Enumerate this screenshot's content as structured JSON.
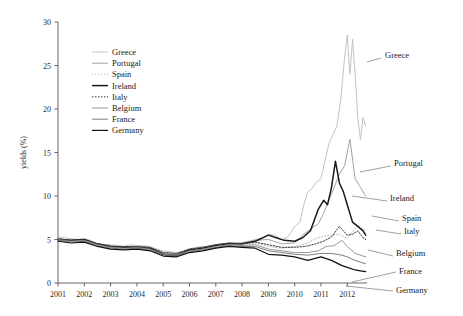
{
  "chart_data": {
    "type": "line",
    "title": "",
    "subtitle": "",
    "xlabel": "",
    "ylabel": "yields (%)",
    "xlim": [
      2001,
      2012.75
    ],
    "ylim": [
      0,
      30
    ],
    "yticks": [
      0,
      5,
      10,
      15,
      20,
      25,
      30
    ],
    "xticks": [
      2001,
      2002,
      2003,
      2004,
      2005,
      2006,
      2007,
      2008,
      2009,
      2010,
      2011,
      2012
    ],
    "xtick_labels": [
      "2001",
      "2002",
      "2003",
      "2004",
      "2005",
      "2006",
      "2007",
      "2008",
      "2009",
      "2010",
      "2011",
      "2012"
    ],
    "ytick_labels": [
      "0",
      "5",
      "10",
      "15",
      "20",
      "25",
      "30"
    ],
    "grid": false,
    "legend_position": "upper-left-inside",
    "series": [
      {
        "name": "Greece",
        "color": "#bcbcbc",
        "width": 0.9,
        "dash": "none",
        "annotation": "Greece",
        "x": [
          2001.0,
          2001.25,
          2001.5,
          2001.75,
          2002.0,
          2002.25,
          2002.5,
          2002.75,
          2003.0,
          2003.25,
          2003.5,
          2003.75,
          2004.0,
          2004.25,
          2004.5,
          2004.75,
          2005.0,
          2005.25,
          2005.5,
          2005.75,
          2006.0,
          2006.25,
          2006.5,
          2006.75,
          2007.0,
          2007.25,
          2007.5,
          2007.75,
          2008.0,
          2008.25,
          2008.5,
          2008.75,
          2009.0,
          2009.25,
          2009.5,
          2009.75,
          2010.0,
          2010.2,
          2010.35,
          2010.5,
          2010.65,
          2010.8,
          2011.0,
          2011.15,
          2011.3,
          2011.45,
          2011.6,
          2011.75,
          2011.9,
          2012.0,
          2012.1,
          2012.2,
          2012.3,
          2012.4,
          2012.5,
          2012.6,
          2012.7
        ],
        "y": [
          5.3,
          5.2,
          5.1,
          5.0,
          5.1,
          4.9,
          4.5,
          4.4,
          4.4,
          4.3,
          4.2,
          4.4,
          4.3,
          4.3,
          4.2,
          3.9,
          3.7,
          3.6,
          3.5,
          3.6,
          3.9,
          4.1,
          4.2,
          4.2,
          4.4,
          4.5,
          4.6,
          4.5,
          4.6,
          4.8,
          5.0,
          5.1,
          5.6,
          5.5,
          5.0,
          5.3,
          6.5,
          7.0,
          9.0,
          10.5,
          10.8,
          11.5,
          12.0,
          14.0,
          16.0,
          17.0,
          18.0,
          21.0,
          26.0,
          28.5,
          24.0,
          28.0,
          24.0,
          19.0,
          16.5,
          19.0,
          18.0
        ]
      },
      {
        "name": "Portugal",
        "color": "#999999",
        "width": 0.9,
        "dash": "none",
        "annotation": "Portugal",
        "x": [
          2001.0,
          2001.5,
          2002.0,
          2002.5,
          2003.0,
          2003.5,
          2004.0,
          2004.5,
          2005.0,
          2005.5,
          2006.0,
          2006.5,
          2007.0,
          2007.5,
          2008.0,
          2008.5,
          2009.0,
          2009.5,
          2010.0,
          2010.3,
          2010.6,
          2010.9,
          2011.1,
          2011.3,
          2011.5,
          2011.7,
          2011.9,
          2012.1,
          2012.3,
          2012.5,
          2012.7
        ],
        "y": [
          5.1,
          4.9,
          5.0,
          4.5,
          4.3,
          4.2,
          4.2,
          4.1,
          3.5,
          3.4,
          3.9,
          4.1,
          4.4,
          4.6,
          4.6,
          4.9,
          5.0,
          4.5,
          4.6,
          5.5,
          6.2,
          6.8,
          8.0,
          9.5,
          11.0,
          12.5,
          13.5,
          16.5,
          12.0,
          11.0,
          10.0
        ]
      },
      {
        "name": "Spain",
        "color": "#b5b5b5",
        "width": 1.0,
        "dash": "1,2",
        "annotation": "Spain",
        "x": [
          2001.0,
          2001.5,
          2002.0,
          2002.5,
          2003.0,
          2003.5,
          2004.0,
          2004.5,
          2005.0,
          2005.5,
          2006.0,
          2006.5,
          2007.0,
          2007.5,
          2008.0,
          2008.5,
          2009.0,
          2009.5,
          2010.0,
          2010.4,
          2010.8,
          2011.1,
          2011.4,
          2011.7,
          2012.0,
          2012.2,
          2012.4,
          2012.6,
          2012.7
        ],
        "y": [
          5.1,
          4.9,
          5.0,
          4.5,
          4.2,
          4.1,
          4.2,
          4.0,
          3.4,
          3.3,
          3.8,
          4.0,
          4.3,
          4.5,
          4.4,
          4.6,
          4.2,
          4.0,
          4.2,
          4.5,
          5.1,
          5.4,
          5.5,
          5.6,
          5.1,
          5.9,
          6.6,
          6.2,
          6.0
        ]
      },
      {
        "name": "Ireland",
        "color": "#1a1a1a",
        "width": 1.5,
        "dash": "none",
        "annotation": "Ireland",
        "x": [
          2001.0,
          2001.5,
          2002.0,
          2002.5,
          2003.0,
          2003.5,
          2004.0,
          2004.5,
          2005.0,
          2005.5,
          2006.0,
          2006.5,
          2007.0,
          2007.5,
          2008.0,
          2008.5,
          2009.0,
          2009.3,
          2009.6,
          2010.0,
          2010.3,
          2010.6,
          2010.9,
          2011.1,
          2011.25,
          2011.4,
          2011.55,
          2011.7,
          2011.85,
          2012.0,
          2012.2,
          2012.4,
          2012.6,
          2012.7
        ],
        "y": [
          5.0,
          4.9,
          5.0,
          4.5,
          4.2,
          4.1,
          4.1,
          4.0,
          3.3,
          3.2,
          3.8,
          4.0,
          4.3,
          4.5,
          4.5,
          4.8,
          5.5,
          5.2,
          4.9,
          4.8,
          5.2,
          6.0,
          8.5,
          9.5,
          9.0,
          11.0,
          14.0,
          11.5,
          10.5,
          9.0,
          7.0,
          6.5,
          6.0,
          5.5
        ]
      },
      {
        "name": "Italy",
        "color": "#3a3a3a",
        "width": 1.0,
        "dash": "1.5,1.5",
        "annotation": "Italy",
        "x": [
          2001.0,
          2001.5,
          2002.0,
          2002.5,
          2003.0,
          2003.5,
          2004.0,
          2004.5,
          2005.0,
          2005.5,
          2006.0,
          2006.5,
          2007.0,
          2007.5,
          2008.0,
          2008.5,
          2009.0,
          2009.5,
          2010.0,
          2010.4,
          2010.8,
          2011.1,
          2011.4,
          2011.7,
          2012.0,
          2012.2,
          2012.4,
          2012.6,
          2012.7
        ],
        "y": [
          5.1,
          4.9,
          5.0,
          4.5,
          4.2,
          4.2,
          4.2,
          4.1,
          3.5,
          3.4,
          3.9,
          4.1,
          4.4,
          4.6,
          4.5,
          4.7,
          4.4,
          4.1,
          4.1,
          4.2,
          4.5,
          4.8,
          5.3,
          6.5,
          5.5,
          5.6,
          6.0,
          5.2,
          5.0
        ]
      },
      {
        "name": "Belgium",
        "color": "#8a8a8a",
        "width": 0.9,
        "dash": "none",
        "annotation": "Belgium",
        "x": [
          2001.0,
          2001.5,
          2002.0,
          2002.5,
          2003.0,
          2003.5,
          2004.0,
          2004.5,
          2005.0,
          2005.5,
          2006.0,
          2006.5,
          2007.0,
          2007.5,
          2008.0,
          2008.5,
          2009.0,
          2009.5,
          2010.0,
          2010.5,
          2010.9,
          2011.2,
          2011.5,
          2011.8,
          2012.0,
          2012.3,
          2012.5,
          2012.7
        ],
        "y": [
          5.0,
          4.8,
          4.9,
          4.4,
          4.1,
          4.0,
          4.1,
          3.9,
          3.3,
          3.2,
          3.7,
          3.9,
          4.2,
          4.4,
          4.3,
          4.4,
          3.9,
          3.7,
          3.5,
          3.5,
          3.7,
          4.2,
          4.3,
          4.9,
          4.2,
          3.4,
          3.2,
          3.0
        ]
      },
      {
        "name": "France",
        "color": "#6e6e6e",
        "width": 0.9,
        "dash": "none",
        "annotation": "France",
        "x": [
          2001.0,
          2001.5,
          2002.0,
          2002.5,
          2003.0,
          2003.5,
          2004.0,
          2004.5,
          2005.0,
          2005.5,
          2006.0,
          2006.5,
          2007.0,
          2007.5,
          2008.0,
          2008.5,
          2009.0,
          2009.5,
          2010.0,
          2010.5,
          2011.0,
          2011.4,
          2011.8,
          2012.0,
          2012.3,
          2012.5,
          2012.7
        ],
        "y": [
          4.9,
          4.7,
          4.8,
          4.3,
          4.0,
          3.9,
          4.0,
          3.8,
          3.2,
          3.1,
          3.6,
          3.8,
          4.1,
          4.3,
          4.2,
          4.2,
          3.7,
          3.5,
          3.3,
          3.2,
          3.4,
          3.4,
          3.2,
          3.0,
          2.6,
          2.4,
          2.2
        ]
      },
      {
        "name": "Germany",
        "color": "#111111",
        "width": 1.2,
        "dash": "none",
        "annotation": "Germany",
        "x": [
          2001.0,
          2001.5,
          2002.0,
          2002.5,
          2003.0,
          2003.5,
          2004.0,
          2004.5,
          2005.0,
          2005.5,
          2006.0,
          2006.5,
          2007.0,
          2007.5,
          2008.0,
          2008.5,
          2009.0,
          2009.5,
          2010.0,
          2010.5,
          2011.0,
          2011.4,
          2011.8,
          2012.0,
          2012.3,
          2012.5,
          2012.7
        ],
        "y": [
          4.8,
          4.6,
          4.7,
          4.2,
          3.9,
          3.8,
          3.9,
          3.7,
          3.1,
          3.0,
          3.5,
          3.7,
          4.0,
          4.2,
          4.1,
          4.0,
          3.3,
          3.2,
          3.0,
          2.6,
          3.0,
          2.6,
          2.0,
          1.8,
          1.5,
          1.4,
          1.3
        ]
      }
    ],
    "legend_entries": [
      {
        "label": "Greece"
      },
      {
        "label": "Portugal"
      },
      {
        "label": "Spain"
      },
      {
        "label": "Ireland"
      },
      {
        "label": "Italy"
      },
      {
        "label": "Belgium"
      },
      {
        "label": "France"
      },
      {
        "label": "Germany"
      }
    ],
    "annotations": [
      {
        "label": "Greece",
        "x": 385,
        "y": 58
      },
      {
        "label": "Portugal",
        "x": 394,
        "y": 166
      },
      {
        "label": "Ireland",
        "x": 390,
        "y": 201
      },
      {
        "label": "Spain",
        "x": 402,
        "y": 221
      },
      {
        "label": "Italy",
        "x": 404,
        "y": 234
      },
      {
        "label": "Belgium",
        "x": 396,
        "y": 256
      },
      {
        "label": "France",
        "x": 399,
        "y": 274
      },
      {
        "label": "Germany",
        "x": 396,
        "y": 293
      }
    ]
  }
}
